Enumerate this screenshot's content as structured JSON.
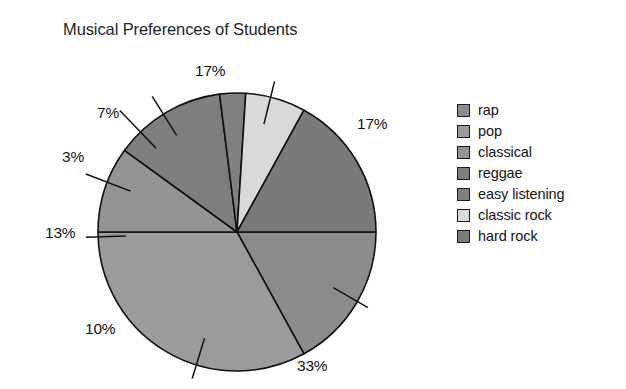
{
  "chart_data": {
    "type": "pie",
    "title": "Musical Preferences of Students",
    "xlabel": "",
    "ylabel": "",
    "categories": [
      "rap",
      "pop",
      "classical",
      "reggae",
      "easy listening",
      "classic rock",
      "hard rock"
    ],
    "values": [
      17,
      33,
      10,
      13,
      3,
      7,
      17
    ],
    "value_labels": [
      "17%",
      "33%",
      "10%",
      "13%",
      "3%",
      "7%",
      "17%"
    ],
    "unit": "%",
    "total": 100,
    "start_angle_deg": 0,
    "direction": "clockwise",
    "grid": false,
    "legend_position": "right",
    "slice_colors": [
      "#8c8c8c",
      "#9b9b9b",
      "#949494",
      "#7e7e7e",
      "#808080",
      "#d9d9d9",
      "#7a7a7a"
    ],
    "legend_swatch_colors": [
      "#8c8c8c",
      "#9b9b9b",
      "#949494",
      "#7e7e7e",
      "#808080",
      "#d9d9d9",
      "#7a7a7a"
    ],
    "outline_color": "#111111",
    "background": "#ffffff",
    "slices": [
      {
        "label": "rap",
        "value": 17,
        "display": "17%",
        "color": "#8c8c8c"
      },
      {
        "label": "pop",
        "value": 33,
        "display": "33%",
        "color": "#9b9b9b"
      },
      {
        "label": "classical",
        "value": 10,
        "display": "10%",
        "color": "#949494"
      },
      {
        "label": "reggae",
        "value": 13,
        "display": "13%",
        "color": "#7e7e7e"
      },
      {
        "label": "easy listening",
        "value": 3,
        "display": "3%",
        "color": "#808080"
      },
      {
        "label": "classic rock",
        "value": 7,
        "display": "7%",
        "color": "#d9d9d9"
      },
      {
        "label": "hard rock",
        "value": 17,
        "display": "17%",
        "color": "#7a7a7a"
      }
    ]
  },
  "legend": {
    "items": [
      {
        "label": "rap"
      },
      {
        "label": "pop"
      },
      {
        "label": "classical"
      },
      {
        "label": "reggae"
      },
      {
        "label": "easy listening"
      },
      {
        "label": "classic rock"
      },
      {
        "label": "hard rock"
      }
    ]
  },
  "labels": {
    "top": "17%",
    "right": "17%",
    "bottom_right": "33%",
    "bottom_left": "10%",
    "left": "13%",
    "upper_left_small": "3%",
    "upper_left": "7%"
  }
}
